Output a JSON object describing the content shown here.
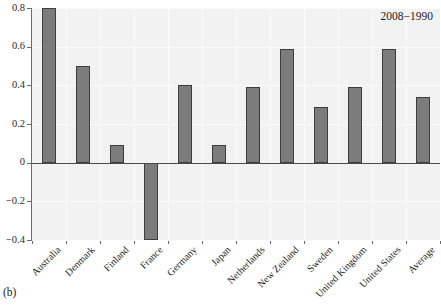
{
  "chart_data": {
    "type": "bar",
    "title": "",
    "subtitle": "",
    "xlabel": "",
    "ylabel": "",
    "categories": [
      "Australia",
      "Denmark",
      "Finland",
      "France",
      "Germany",
      "Japan",
      "Netherlands",
      "New Zealand",
      "Sweden",
      "United Kingdom",
      "United States",
      "Average"
    ],
    "values": [
      0.8,
      0.5,
      0.09,
      -0.4,
      0.4,
      0.09,
      0.39,
      0.59,
      0.29,
      0.39,
      0.59,
      0.34
    ],
    "series": [
      {
        "name": "2008−1990",
        "values": [
          0.8,
          0.5,
          0.09,
          -0.4,
          0.4,
          0.09,
          0.39,
          0.59,
          0.29,
          0.39,
          0.59,
          0.34
        ]
      }
    ],
    "ylim": [
      -0.4,
      0.8
    ],
    "ytick_values": [
      0.8,
      0.6,
      0.4,
      0.2,
      0,
      -0.2,
      -0.4
    ],
    "ytick_labels": [
      "0.8",
      "0.6",
      "0.4",
      "0.2",
      "0",
      "−0.2",
      "−0.4"
    ],
    "grid": true,
    "grid_color": "#fbfbfb",
    "legend": "none",
    "annotations": [
      {
        "text": "2008−1990",
        "position": "top-right"
      }
    ],
    "zero_line": 0,
    "bar_color": "#7c7c7c",
    "bar_edge_color": "#3d3d3d",
    "plot_background": "#f2f2f2",
    "figure_background": "#ffffff"
  },
  "figure": {
    "panel_caption": "(b)",
    "series_annotation": "2008−1990"
  }
}
